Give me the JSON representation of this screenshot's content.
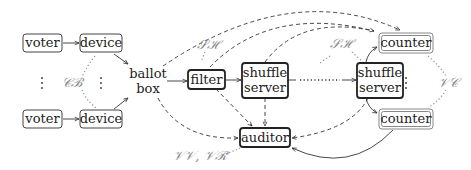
{
  "diagram": {
    "nodes": {
      "voter_top": "voter",
      "device_top": "device",
      "voter_bottom": "voter",
      "device_bottom": "device",
      "ballot_box_line1": "ballot",
      "ballot_box_line2": "box",
      "filter": "filter",
      "shuffle1_line1": "shuffle",
      "shuffle1_line2": "server",
      "shuffle2_line1": "shuffle",
      "shuffle2_line2": "server",
      "auditor": "auditor",
      "counter_top": "counter",
      "counter_bottom": "counter"
    },
    "labels": {
      "cb": "𝒞ℬ",
      "sh1": "𝒮ℋ",
      "sh2": "𝒮ℋ",
      "vc": "𝒱𝒞",
      "vv_vr": "𝒱𝒱, 𝒱ℛ"
    },
    "ellipsis": {
      "vertical": "⋮",
      "horizontal": "· · ·"
    },
    "edges": [
      {
        "from": "voter_top",
        "to": "device_top",
        "style": "solid"
      },
      {
        "from": "voter_bottom",
        "to": "device_bottom",
        "style": "solid"
      },
      {
        "from": "device_top",
        "to": "ballot_box",
        "style": "solid"
      },
      {
        "from": "device_bottom",
        "to": "ballot_box",
        "style": "solid"
      },
      {
        "from": "ballot_box",
        "to": "filter",
        "style": "solid"
      },
      {
        "from": "filter",
        "to": "shuffle1",
        "style": "solid"
      },
      {
        "from": "shuffle1",
        "to": "shuffle2",
        "style": "dotted-then-solid"
      },
      {
        "from": "shuffle2",
        "to": "counter_top",
        "style": "solid"
      },
      {
        "from": "shuffle2",
        "to": "counter_bottom",
        "style": "solid"
      },
      {
        "from": "counter_bottom",
        "to": "auditor",
        "style": "solid"
      },
      {
        "from": "ballot_box",
        "to": "counter_top",
        "style": "dashed"
      },
      {
        "from": "filter",
        "to": "counter_top",
        "style": "dashed"
      },
      {
        "from": "shuffle1",
        "to": "counter_top",
        "style": "dashed"
      },
      {
        "from": "ballot_box",
        "to": "auditor",
        "style": "dashed"
      },
      {
        "from": "filter",
        "to": "auditor",
        "style": "dashed"
      },
      {
        "from": "shuffle1",
        "to": "auditor",
        "style": "dashed"
      },
      {
        "from": "shuffle2",
        "to": "auditor",
        "style": "dashed"
      }
    ]
  }
}
